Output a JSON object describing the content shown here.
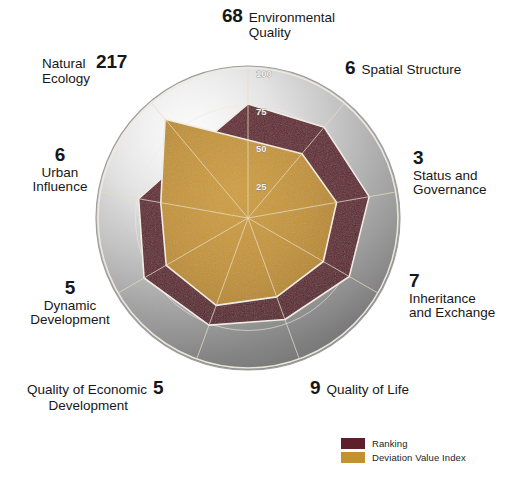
{
  "chart_data": {
    "type": "radar",
    "title": "",
    "center": {
      "x": 248,
      "y": 218
    },
    "outer_radius": 150,
    "rlim": [
      0,
      100
    ],
    "ticks": [
      25,
      50,
      75,
      100
    ],
    "tick_labels": [
      "25",
      "50",
      "75",
      "100"
    ],
    "grid": true,
    "legend_position": "bottom-right",
    "categories": [
      "Environmental Quality",
      "Spatial Structure",
      "Status and Governance",
      "Inheritance and Exchange",
      "Quality of Life",
      "Quality of Economic Development",
      "Dynamic Development",
      "Urban Influence",
      "Natural Ecology"
    ],
    "rank_values": [
      68,
      6,
      3,
      7,
      9,
      5,
      5,
      6,
      217
    ],
    "series": [
      {
        "name": "Ranking",
        "color": "#5d1f2b",
        "values": [
          76,
          79,
          82,
          78,
          72,
          76,
          80,
          74,
          58
        ]
      },
      {
        "name": "Deviation Value Index",
        "color": "#c2922f",
        "values": [
          52,
          56,
          60,
          58,
          56,
          62,
          63,
          59,
          86
        ]
      }
    ]
  },
  "axes": [
    {
      "key": "environmental-quality",
      "number": "68",
      "name_line1": "Environmental",
      "name_line2": "Quality"
    },
    {
      "key": "spatial-structure",
      "number": "6",
      "name_line1": "Spatial Structure",
      "name_line2": ""
    },
    {
      "key": "status-and-governance",
      "number": "3",
      "name_line1": "Status and",
      "name_line2": "Governance"
    },
    {
      "key": "inheritance-and-exchange",
      "number": "7",
      "name_line1": "Inheritance",
      "name_line2": "and Exchange"
    },
    {
      "key": "quality-of-life",
      "number": "9",
      "name_line1": "Quality of Life",
      "name_line2": ""
    },
    {
      "key": "quality-of-economic-development",
      "number": "5",
      "name_line1": "Quality of Economic",
      "name_line2": "Development"
    },
    {
      "key": "dynamic-development",
      "number": "5",
      "name_line1": "Dynamic",
      "name_line2": "Development"
    },
    {
      "key": "urban-influence",
      "number": "6",
      "name_line1": "Urban",
      "name_line2": "Influence"
    },
    {
      "key": "natural-ecology",
      "number": "217",
      "name_line1": "Natural",
      "name_line2": "Ecology"
    }
  ],
  "radial_ticks": [
    "100",
    "75",
    "50",
    "25"
  ],
  "legend": {
    "items": [
      {
        "label": "Ranking",
        "color": "#5d1f2b"
      },
      {
        "label": "Deviation Value Index",
        "color": "#c2922f"
      }
    ]
  },
  "colors": {
    "ranking": "#5d1f2b",
    "deviation": "#c2922f",
    "sphere_light": "#e9e9e9",
    "sphere_dark": "#8d8d8d",
    "grid_line": "#d8c9a0",
    "outline": "#f2eee4",
    "text": "#171717",
    "background": "#ffffff"
  }
}
